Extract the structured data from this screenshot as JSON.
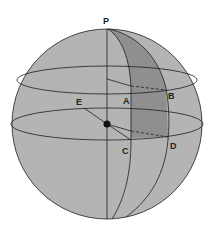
{
  "diagram": {
    "type": "sphere-latitude-longitude",
    "colors": {
      "background": "#ffffff",
      "sphere_fill": "#b4b4b4",
      "band_fill": "#8f8f8f",
      "stroke": "#1e1e1e"
    },
    "labels": {
      "pole": "P",
      "a": "A",
      "b": "B",
      "c": "C",
      "d": "D",
      "e": "E"
    }
  }
}
